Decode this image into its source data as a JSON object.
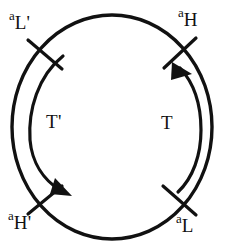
{
  "figure": {
    "name": "circular-chromosome-replication-diagram",
    "background_color": "#ffffff",
    "stroke_color": "#111111"
  },
  "circle": {
    "center_x": 112,
    "center_y": 127,
    "radius_x": 100,
    "radius_y": 112,
    "stroke_width": 3.2
  },
  "sites": [
    {
      "id": "a-L-prime",
      "base": "a",
      "subscript": "L'",
      "position": "top-left",
      "tick_angle_deg": 138,
      "label_x": 9,
      "label_y": 9
    },
    {
      "id": "a-H",
      "base": "a",
      "subscript": "H",
      "position": "top-right",
      "tick_angle_deg": 42,
      "label_x": 178,
      "label_y": 6
    },
    {
      "id": "a-H-prime",
      "base": "a",
      "subscript": "H'",
      "position": "bottom-left",
      "tick_angle_deg": 222,
      "label_x": 8,
      "label_y": 209
    },
    {
      "id": "a-L",
      "base": "a",
      "subscript": "L",
      "position": "bottom-right",
      "tick_angle_deg": 318,
      "label_x": 176,
      "label_y": 212
    }
  ],
  "arcs": [
    {
      "id": "arc-T-prime",
      "label": "T'",
      "side": "left",
      "direction": "downward",
      "arrow_position": "bottom",
      "label_x": 46,
      "label_y": 112
    },
    {
      "id": "arc-T",
      "label": "T",
      "side": "right",
      "direction": "upward",
      "arrow_position": "top",
      "label_x": 161,
      "label_y": 113
    }
  ]
}
